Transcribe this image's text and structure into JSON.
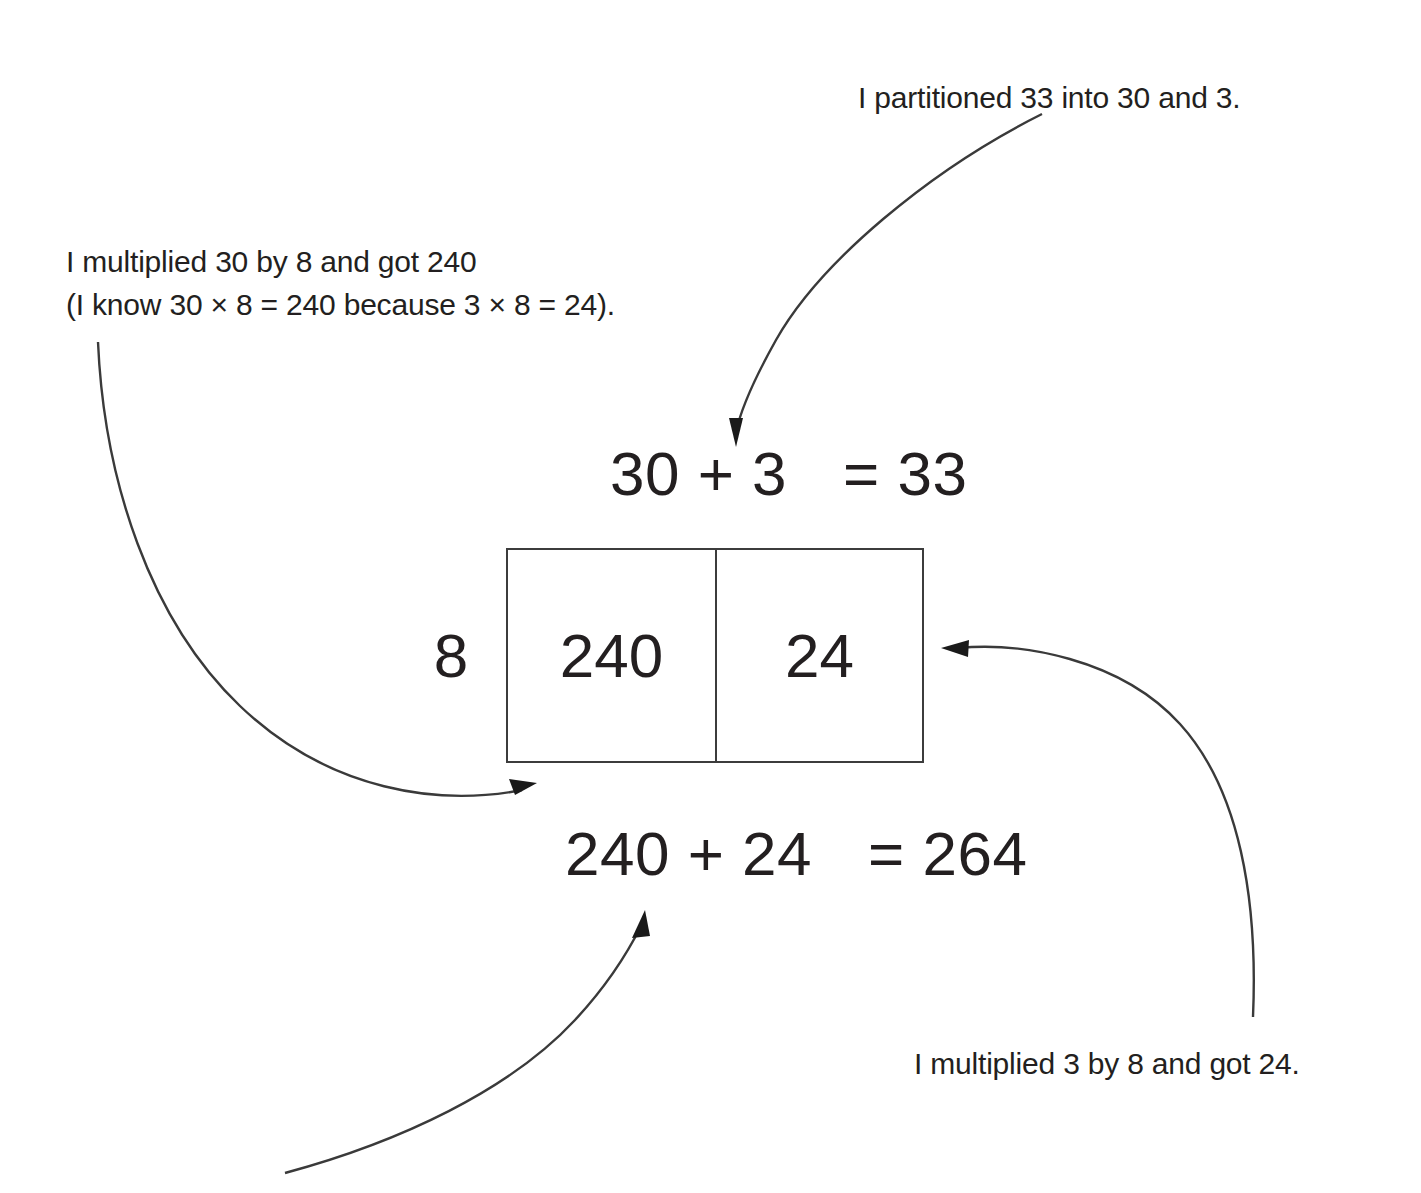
{
  "diagram": {
    "multiplier_label": "8",
    "grid": {
      "cells": [
        {
          "value": "240"
        },
        {
          "value": "24"
        }
      ]
    },
    "equations": {
      "top": {
        "left": "30 + 3",
        "operator": "=",
        "result": "33"
      },
      "bottom": {
        "left": "240 + 24",
        "operator": "=",
        "result": "264"
      }
    },
    "annotations": {
      "partition": "I partitioned 33 into 30 and 3.",
      "multiply_30_line1": "I multiplied 30 by 8 and got 240",
      "multiply_30_line2": "(I know 30 × 8 = 240 because 3 × 8 = 24).",
      "multiply_3": "I multiplied 3 by 8 and got 24."
    },
    "colors": {
      "background": "#ffffff",
      "ink": "#231f20",
      "rule": "#3c3c3c",
      "arrow": "#3a3a3a"
    }
  }
}
